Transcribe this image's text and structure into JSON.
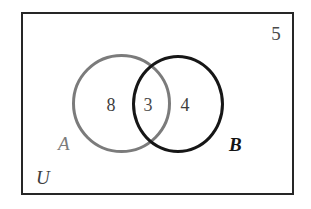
{
  "diagram": {
    "type": "venn-two-set",
    "universe": {
      "label": "U",
      "outside_count": "5",
      "border_color": "#262626"
    },
    "sets": [
      {
        "id": "A",
        "label": "A",
        "color": "#7b7b7b",
        "only_count": "8"
      },
      {
        "id": "B",
        "label": "B",
        "color": "#161616",
        "only_count": "4"
      }
    ],
    "intersection": {
      "label": "A and B",
      "count": "3"
    }
  },
  "chart_data": {
    "type": "venn",
    "title": "",
    "set_labels": [
      "A",
      "B"
    ],
    "universe_label": "U",
    "regions": [
      {
        "name": "A only",
        "value": 8
      },
      {
        "name": "A intersect B",
        "value": 3
      },
      {
        "name": "B only",
        "value": 4
      },
      {
        "name": "outside both (universe only)",
        "value": 5
      }
    ],
    "totals": {
      "A": 11,
      "B": 7,
      "universe": 20
    },
    "colors": {
      "set_a_outline": "#7b7b7b",
      "set_b_outline": "#161616",
      "universe_outline": "#262626",
      "text": "#3d3d3d",
      "background": "#ffffff"
    }
  }
}
